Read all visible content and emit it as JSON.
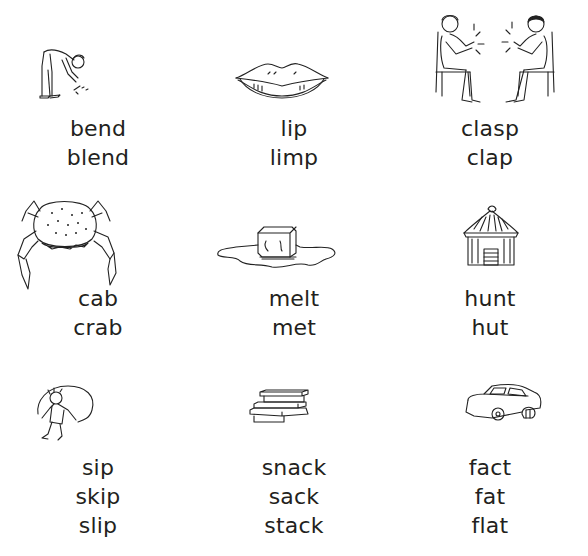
{
  "worksheet": {
    "items": [
      {
        "picture": "man-bending-icon",
        "words": [
          "bend",
          "blend"
        ]
      },
      {
        "picture": "lips-icon",
        "words": [
          "lip",
          "limp"
        ]
      },
      {
        "picture": "people-clapping-icon",
        "words": [
          "clasp",
          "clap"
        ]
      },
      {
        "picture": "crab-icon",
        "words": [
          "cab",
          "crab"
        ]
      },
      {
        "picture": "melting-ice-cube-icon",
        "words": [
          "melt",
          "met"
        ]
      },
      {
        "picture": "hut-icon",
        "words": [
          "hunt",
          "hut"
        ]
      },
      {
        "picture": "child-skipping-rope-icon",
        "words": [
          "sip",
          "skip",
          "slip"
        ]
      },
      {
        "picture": "stack-of-books-icon",
        "words": [
          "snack",
          "sack",
          "stack"
        ]
      },
      {
        "picture": "flat-tyre-car-icon",
        "words": [
          "fact",
          "fat",
          "flat"
        ]
      }
    ]
  },
  "colors": {
    "text": "#231f20",
    "background": "#ffffff"
  }
}
